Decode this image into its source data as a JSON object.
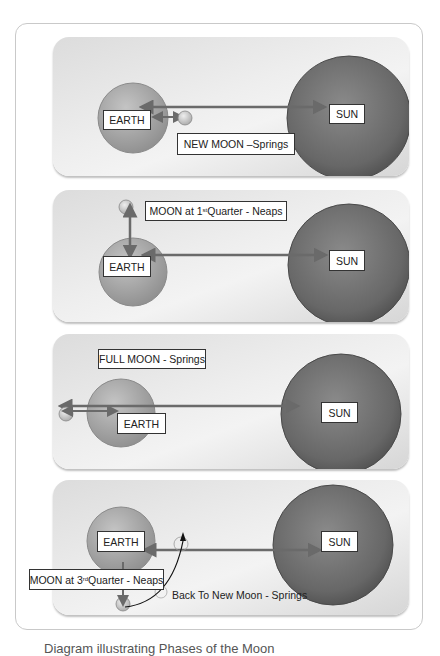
{
  "colors": {
    "frame_border": "#c9c9c9",
    "panel_bg": "#e8e8e8",
    "earth_fill": "#9d9d9d",
    "sun_fill": "#6f6f6f",
    "arrow": "#6a6a6a",
    "label_border": "#333333"
  },
  "diagram": {
    "panels": [
      {
        "id": "new-moon",
        "earth_label": "EARTH",
        "sun_label": "SUN",
        "phase_label": "NEW MOON –Springs",
        "tide": "Springs"
      },
      {
        "id": "first-quarter",
        "earth_label": "EARTH",
        "sun_label": "SUN",
        "phase_label_pre": "MOON at 1",
        "phase_label_sup": "st",
        "phase_label_post": " Quarter - Neaps",
        "tide": "Neaps"
      },
      {
        "id": "full-moon",
        "earth_label": "EARTH",
        "sun_label": "SUN",
        "phase_label": "FULL MOON - Springs",
        "tide": "Springs"
      },
      {
        "id": "third-quarter",
        "earth_label": "EARTH",
        "sun_label": "SUN",
        "phase_label_pre": "MOON at 3",
        "phase_label_sup": "rd",
        "phase_label_post": " Quarter - Neaps",
        "return_label": "Back To New Moon - Springs",
        "tide": "Neaps"
      }
    ]
  },
  "caption": {
    "text": "Diagram illustrating Phases of the Moon"
  }
}
